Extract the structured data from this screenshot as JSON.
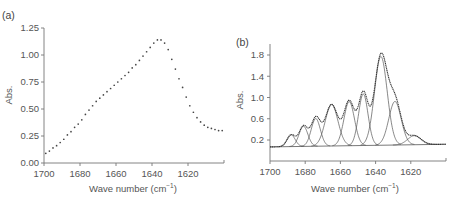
{
  "chart_data": [
    {
      "panel": "(a)",
      "type": "scatter",
      "title": "",
      "xlabel": "Wave number (cm⁻¹)",
      "ylabel": "Abs.",
      "xlim": [
        1700,
        1600
      ],
      "ylim": [
        0.0,
        1.25
      ],
      "x_ticks": [
        1700,
        1680,
        1660,
        1640,
        1620
      ],
      "y_ticks": [
        "0.00",
        "0.25",
        "0.50",
        "0.75",
        "1.00",
        "1.25"
      ],
      "grid": false,
      "series": [
        {
          "name": "measured spectrum",
          "x": [
            1699,
            1697,
            1695,
            1693,
            1691,
            1689,
            1687,
            1685,
            1683,
            1681,
            1679,
            1677,
            1675,
            1673,
            1671,
            1669,
            1667,
            1665,
            1663,
            1661,
            1659,
            1657,
            1655,
            1653,
            1651,
            1649,
            1647,
            1645,
            1643,
            1641,
            1639,
            1637,
            1635,
            1633,
            1631,
            1629,
            1627,
            1625,
            1623,
            1621,
            1619,
            1617,
            1615,
            1613,
            1611,
            1609,
            1607,
            1605,
            1603,
            1601
          ],
          "values": [
            0.09,
            0.11,
            0.14,
            0.16,
            0.19,
            0.22,
            0.26,
            0.29,
            0.33,
            0.36,
            0.4,
            0.45,
            0.49,
            0.53,
            0.57,
            0.6,
            0.63,
            0.66,
            0.69,
            0.72,
            0.75,
            0.78,
            0.81,
            0.84,
            0.88,
            0.91,
            0.95,
            0.99,
            1.03,
            1.07,
            1.11,
            1.14,
            1.14,
            1.11,
            1.05,
            0.96,
            0.87,
            0.78,
            0.7,
            0.61,
            0.53,
            0.47,
            0.42,
            0.38,
            0.35,
            0.33,
            0.32,
            0.31,
            0.3,
            0.3
          ]
        }
      ]
    },
    {
      "panel": "(b)",
      "type": "line",
      "title": "",
      "xlabel": "Wave number (cm⁻¹)",
      "ylabel": "Abs.",
      "xlim": [
        1700,
        1600
      ],
      "ylim": [
        -0.1,
        2.0
      ],
      "x_ticks": [
        1700,
        1680,
        1660,
        1640,
        1620
      ],
      "y_ticks": [
        "0.2",
        "0.6",
        "1.0",
        "1.4",
        "1.8"
      ],
      "grid": false,
      "baseline": {
        "x": [
          1700,
          1600
        ],
        "values": [
          0.07,
          0.12
        ]
      },
      "components": [
        {
          "center": 1688,
          "height": 0.22,
          "width": 2.3
        },
        {
          "center": 1681,
          "height": 0.38,
          "width": 2.5
        },
        {
          "center": 1674,
          "height": 0.52,
          "width": 2.6
        },
        {
          "center": 1665,
          "height": 0.78,
          "width": 3.6
        },
        {
          "center": 1655,
          "height": 0.83,
          "width": 3.0
        },
        {
          "center": 1647,
          "height": 0.97,
          "width": 2.7
        },
        {
          "center": 1637,
          "height": 1.67,
          "width": 3.6
        },
        {
          "center": 1629,
          "height": 0.82,
          "width": 3.5
        },
        {
          "center": 1618,
          "height": 0.17,
          "width": 3.8
        }
      ],
      "series": [
        {
          "name": "envelope (sum of components)",
          "peak_x": 1637,
          "peak_value": 1.95
        },
        {
          "name": "fitted components",
          "count": 9
        }
      ]
    }
  ],
  "labels": {
    "panel_a": "(a)",
    "panel_b": "(b)",
    "xlabel_main": "Wave number (cm",
    "xlabel_sup": "−1",
    "xlabel_close": ")",
    "ylabel": "Abs."
  }
}
